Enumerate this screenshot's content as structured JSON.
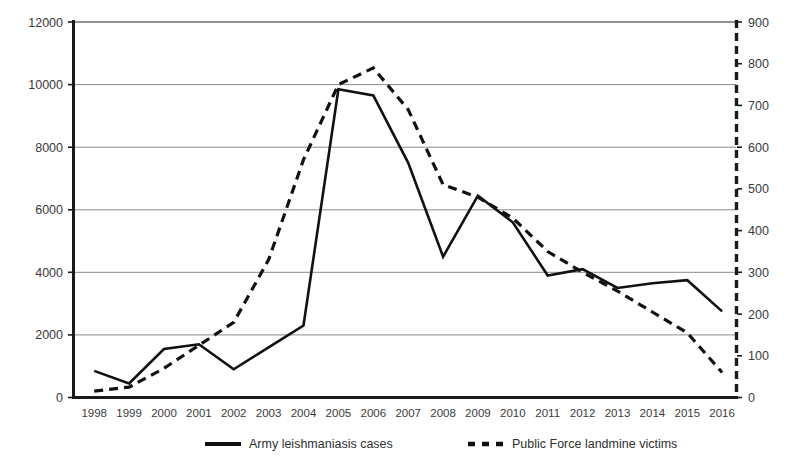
{
  "chart_data": {
    "type": "line",
    "title": "",
    "subtitle": "",
    "xlabel": "",
    "ylabel": "",
    "grid": true,
    "legend_position": "bottom",
    "categories": [
      "1998",
      "1999",
      "2000",
      "2001",
      "2002",
      "2003",
      "2004",
      "2005",
      "2006",
      "2007",
      "2008",
      "2009",
      "2010",
      "2011",
      "2012",
      "2013",
      "2014",
      "2015",
      "2016"
    ],
    "x": [
      1998,
      1999,
      2000,
      2001,
      2002,
      2003,
      2004,
      2005,
      2006,
      2007,
      2008,
      2009,
      2010,
      2011,
      2012,
      2013,
      2014,
      2015,
      2016
    ],
    "axes": {
      "left": {
        "label": "",
        "ylim": [
          0,
          12000
        ],
        "tick_step": 2000,
        "ticks": [
          "0",
          "2000",
          "4000",
          "6000",
          "8000",
          "10000",
          "12000"
        ],
        "tick_values": [
          0,
          2000,
          4000,
          6000,
          8000,
          10000,
          12000
        ]
      },
      "right": {
        "label": "",
        "ylim": [
          0,
          900
        ],
        "tick_step": 100,
        "ticks": [
          "0",
          "100",
          "200",
          "300",
          "400",
          "500",
          "600",
          "700",
          "800",
          "900"
        ],
        "tick_values": [
          0,
          100,
          200,
          300,
          400,
          500,
          600,
          700,
          800,
          900
        ]
      }
    },
    "series": [
      {
        "name": "Army leishmaniasis cases",
        "axis": "left",
        "style": "solid",
        "color": "#111111",
        "values": [
          850,
          450,
          1550,
          1700,
          900,
          1600,
          2300,
          9850,
          9650,
          7500,
          4500,
          6450,
          5600,
          3900,
          4100,
          3500,
          3650,
          3750,
          2750
        ]
      },
      {
        "name": "Public Force landmine victims",
        "axis": "right",
        "style": "dashed",
        "color": "#111111",
        "values": [
          15,
          25,
          70,
          125,
          180,
          330,
          570,
          750,
          790,
          690,
          510,
          480,
          430,
          350,
          300,
          255,
          205,
          155,
          60
        ]
      }
    ],
    "legend": [
      {
        "label": "Army leishmaniasis cases",
        "style": "solid"
      },
      {
        "label": "Public Force landmine victims",
        "style": "dashed"
      }
    ]
  }
}
